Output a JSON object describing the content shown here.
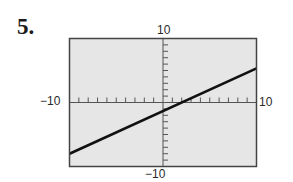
{
  "problem": {
    "number": "5."
  },
  "chart_data": {
    "type": "line",
    "title": "",
    "xlabel": "",
    "ylabel": "",
    "xlim": [
      -10,
      10
    ],
    "ylim": [
      -10,
      10
    ],
    "grid": false,
    "background": "#e6e6e6",
    "tick_step": 1,
    "tick_labels": {
      "x_min": "−10",
      "x_max": "10",
      "y_min": "−10",
      "y_max": "10"
    },
    "series": [
      {
        "name": "line",
        "color": "#111111",
        "x": [
          -10,
          10
        ],
        "y": [
          -8,
          5.33
        ],
        "equation_estimate": "y = (2/3)x - 4/3"
      }
    ]
  }
}
